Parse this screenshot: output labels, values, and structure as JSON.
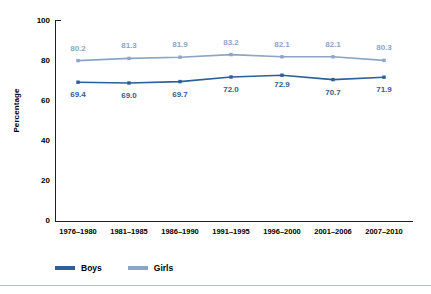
{
  "chart_data": {
    "type": "line",
    "title": "",
    "subtitle": "",
    "xlabel": "",
    "ylabel": "Percentage",
    "ylim": [
      0,
      100
    ],
    "yticks": [
      "0",
      "20",
      "40",
      "60",
      "80",
      "100"
    ],
    "grid": false,
    "legend_position": "bottom-left",
    "categories": [
      "1976–1980",
      "1981–1985",
      "1986–1990",
      "1991–1995",
      "1996–2000",
      "2001–2006",
      "2007–2010"
    ],
    "series": [
      {
        "name": "Boys",
        "color": "#2c5f96",
        "values": [
          69.4,
          69.0,
          69.7,
          72.0,
          72.9,
          70.7,
          71.9
        ],
        "labels": [
          "69.4",
          "69.0",
          "69.7",
          "72.0",
          "72.9",
          "70.7",
          "71.9"
        ]
      },
      {
        "name": "Girls",
        "color": "#8ba5c9",
        "values": [
          80.2,
          81.3,
          81.9,
          83.2,
          82.1,
          82.1,
          80.3
        ],
        "labels": [
          "80.2",
          "81.3",
          "81.9",
          "83.2",
          "82.1",
          "82.1",
          "80.3"
        ]
      }
    ]
  },
  "legend": {
    "items": [
      {
        "label": "Boys",
        "color": "#2c5f96"
      },
      {
        "label": "Girls",
        "color": "#8ba5c9"
      }
    ]
  },
  "axes": {
    "y_title": "Percentage",
    "y_tick_labels": [
      "100",
      "80",
      "60",
      "40",
      "20",
      "0"
    ],
    "x_tick_labels": [
      "1976–1980",
      "1981–1985",
      "1986–1990",
      "1991–1995",
      "1996–2000",
      "2001–2006",
      "2007–2010"
    ]
  },
  "colors": {
    "boys": "#2c5f96",
    "girls": "#8ba5c9",
    "axis": "#231f20",
    "background": "#ffffff"
  }
}
